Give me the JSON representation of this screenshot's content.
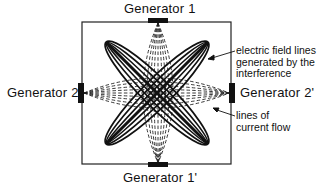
{
  "diagram": {
    "type": "interferential current field diagram",
    "generators": {
      "top": "Generator 1",
      "bottom": "Generator 1'",
      "left": "Generator 2",
      "right": "Generator 2'"
    },
    "annotations": {
      "field_lines": {
        "line1": "electric field lines",
        "line2": "generated by the",
        "line3": "interference"
      },
      "current_flow": {
        "line1": "lines of",
        "line2": "current flow"
      }
    },
    "legend_styles": {
      "field_lines": "solid thick ellipses (diagonal)",
      "current_flow": "dashed arcs between opposing generators"
    },
    "colors": {
      "ink": "#111111",
      "background": "#ffffff"
    }
  }
}
